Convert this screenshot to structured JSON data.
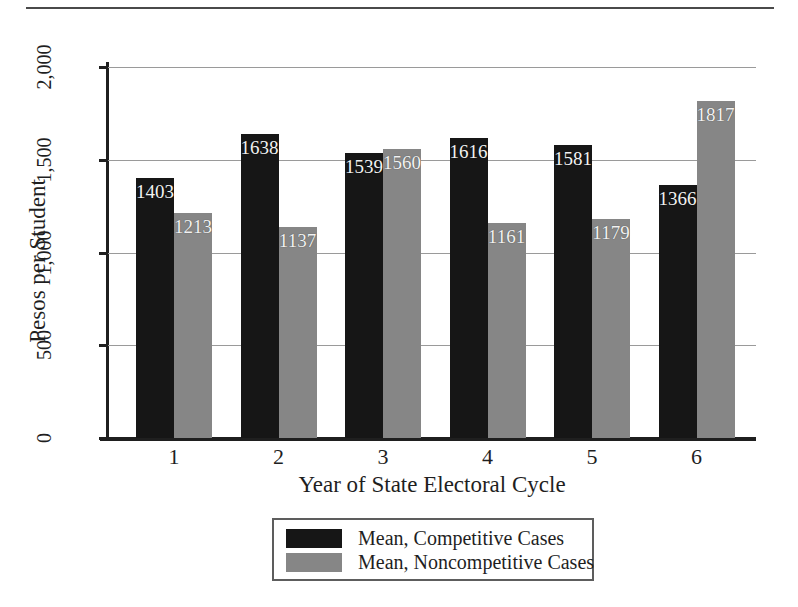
{
  "chart_data": {
    "type": "bar",
    "title": "",
    "xlabel": "Year of State Electoral Cycle",
    "ylabel": "Pesos per Student",
    "categories": [
      "1",
      "2",
      "3",
      "4",
      "5",
      "6"
    ],
    "ylim": [
      0,
      2000
    ],
    "yticks": [
      0,
      500,
      1000,
      1500,
      2000
    ],
    "ytick_labels": [
      "0",
      "500",
      "1,000",
      "1,500",
      "2,000"
    ],
    "grid": true,
    "grid_axis": "y",
    "legend_position": "bottom-center",
    "series": [
      {
        "name": "Mean, Competitive Cases",
        "color": "#161616",
        "values": [
          1403,
          1638,
          1539,
          1616,
          1581,
          1366
        ],
        "labels": [
          "1403",
          "1638",
          "1539",
          "1616",
          "1581",
          "1366"
        ]
      },
      {
        "name": "Mean, Noncompetitive Cases",
        "color": "#868686",
        "values": [
          1213,
          1137,
          1560,
          1161,
          1179,
          1817
        ],
        "labels": [
          "1213",
          "1137",
          "1560",
          "1161",
          "1179",
          "1817"
        ]
      }
    ]
  },
  "axes": {
    "y_title": "Pesos per Student",
    "x_title": "Year of State Electoral Cycle",
    "y_tick_labels": [
      "2,000",
      "1,500",
      "1,000",
      "500",
      "0"
    ],
    "x_tick_labels": [
      "1",
      "2",
      "3",
      "4",
      "5",
      "6"
    ]
  },
  "legend": {
    "items": [
      {
        "label": "Mean, Competitive Cases",
        "color": "#161616"
      },
      {
        "label": "Mean, Noncompetitive Cases",
        "color": "#868686"
      }
    ]
  },
  "colors": {
    "competitive": "#161616",
    "noncompetitive": "#868686",
    "axis": "#1f1f1f",
    "gridline": "#9a9a9a",
    "rule": "#4a4a4a",
    "bar_label_text": "#f2f2f2"
  }
}
